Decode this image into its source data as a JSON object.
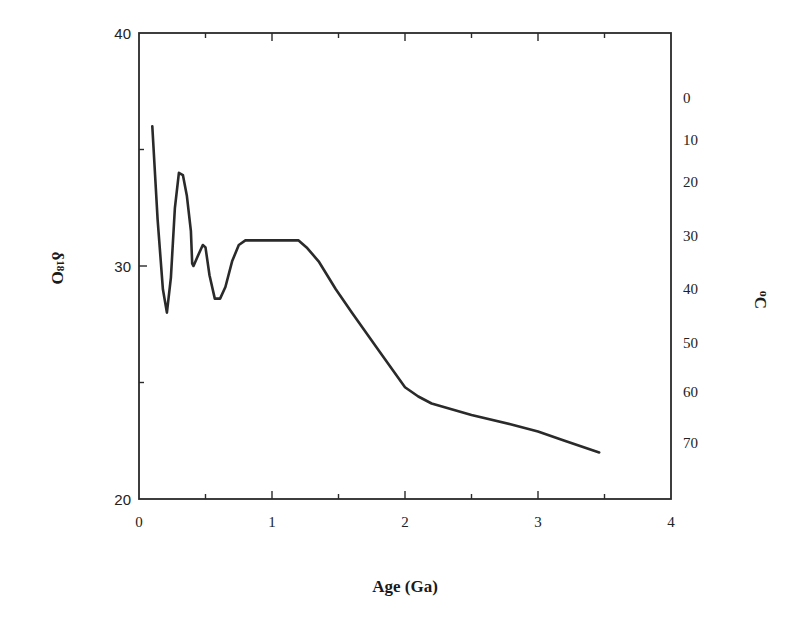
{
  "chart_data": {
    "type": "line",
    "title": "",
    "xlabel": "Age (Ga)",
    "ylabel": "δ18O",
    "ylabel_right": "oC",
    "xlim": [
      0,
      4
    ],
    "ylim": [
      20,
      40
    ],
    "x_ticks": [
      "0",
      "1",
      "2",
      "3",
      "4"
    ],
    "y_ticks": [
      "20",
      "30",
      "40"
    ],
    "y_right_ticks": [
      "0",
      "10",
      "20",
      "30",
      "40",
      "50",
      "60",
      "70"
    ],
    "y_right_tick_positions_d18O": [
      37.2,
      35.4,
      33.6,
      31.3,
      29.0,
      26.7,
      24.6,
      22.4
    ],
    "grid": false,
    "legend": null,
    "series": [
      {
        "name": "δ18O",
        "color": "#2a2a2a",
        "x": [
          0.1,
          0.14,
          0.18,
          0.21,
          0.24,
          0.27,
          0.3,
          0.33,
          0.36,
          0.39,
          0.4,
          0.41,
          0.44,
          0.48,
          0.5,
          0.53,
          0.57,
          0.61,
          0.65,
          0.7,
          0.75,
          0.8,
          1.0,
          1.2,
          1.26,
          1.35,
          1.48,
          1.6,
          1.8,
          2.0,
          2.1,
          2.2,
          2.5,
          2.8,
          3.0,
          3.2,
          3.46
        ],
        "y": [
          36.0,
          32.0,
          29.0,
          28.0,
          29.5,
          32.5,
          34.0,
          33.9,
          33.0,
          31.5,
          30.1,
          30.0,
          30.4,
          30.9,
          30.8,
          29.6,
          28.6,
          28.6,
          29.1,
          30.2,
          30.9,
          31.1,
          31.1,
          31.1,
          30.8,
          30.2,
          29.0,
          28.0,
          26.4,
          24.8,
          24.4,
          24.1,
          23.6,
          23.2,
          22.9,
          22.5,
          22.0
        ]
      }
    ]
  },
  "axes": {
    "x_title": "Age (Ga)",
    "y_title_prefix": "δ",
    "y_title_sup": "18",
    "y_title_suffix": "O",
    "y_right_title_sup": "o",
    "y_right_title": "C"
  }
}
